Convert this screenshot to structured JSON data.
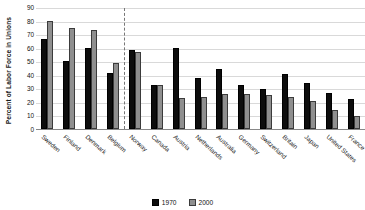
{
  "chart_data": {
    "type": "bar",
    "title": "",
    "xlabel": "",
    "ylabel": "Percent of Labor Force in Unions",
    "ylim": [
      0,
      90
    ],
    "yticks": [
      0,
      10,
      20,
      30,
      40,
      50,
      60,
      70,
      80,
      90
    ],
    "grid": true,
    "legend_position": "bottom-center",
    "categories": [
      "Sweden",
      "Finland",
      "Denmark",
      "Belgium",
      "Norway",
      "Canada",
      "Austria",
      "Netherlands",
      "Australia",
      "Germany",
      "Switzerland",
      "Britain",
      "Japan",
      "United States",
      "France"
    ],
    "series": [
      {
        "name": "1970",
        "color": "#0d0d0d",
        "values": [
          67,
          50.5,
          60,
          42,
          58.5,
          32.5,
          60,
          38,
          45,
          33,
          29.5,
          41,
          34,
          27,
          22
        ]
      },
      {
        "name": "2000",
        "color": "#8f8f8f",
        "values": [
          80,
          75,
          74,
          49,
          57,
          33,
          23,
          24,
          26,
          26,
          25,
          24,
          21,
          14,
          10
        ]
      }
    ],
    "annotations": [
      {
        "type": "vertical-divider",
        "style": "dashed",
        "after_category": "Belgium"
      }
    ],
    "legend": [
      {
        "label": "1970",
        "color": "#0d0d0d"
      },
      {
        "label": "2000",
        "color": "#8f8f8f"
      }
    ]
  }
}
